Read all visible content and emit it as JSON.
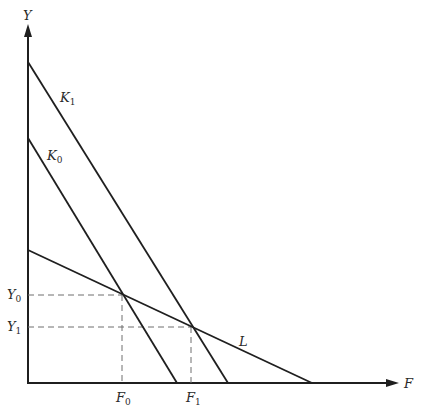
{
  "diagram": {
    "type": "economic-line-diagram",
    "axes": {
      "y_label": "Y",
      "x_label": "F"
    },
    "lines": [
      {
        "id": "K1",
        "label": "K",
        "subscript": "1",
        "from": [
          28,
          62
        ],
        "to": [
          228,
          383
        ]
      },
      {
        "id": "K0",
        "label": "K",
        "subscript": "0",
        "from": [
          28,
          138
        ],
        "to": [
          177,
          383
        ]
      },
      {
        "id": "L",
        "label": "L",
        "subscript": "",
        "from": [
          28,
          250
        ],
        "to": [
          312,
          383
        ]
      }
    ],
    "points": [
      {
        "id": "E0",
        "x": 122,
        "y": 295,
        "x_label": "F",
        "x_sub": "0",
        "y_label": "Y",
        "y_sub": "0"
      },
      {
        "id": "E1",
        "x": 191,
        "y": 327,
        "x_label": "F",
        "x_sub": "1",
        "y_label": "Y",
        "y_sub": "1"
      }
    ],
    "colors": {
      "line": "#1f1f1f",
      "dash": "#6e6e6e",
      "background": "#ffffff"
    }
  }
}
